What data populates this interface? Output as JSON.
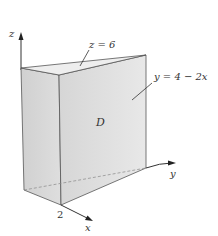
{
  "diagram": {
    "type": "3d-solid-region",
    "labels": {
      "z_axis": "z",
      "y_axis": "y",
      "x_axis": "x",
      "x_tick": "2",
      "top_plane": "z = 6",
      "slant_plane": "y = 4 − 2x",
      "region": "D"
    },
    "colors": {
      "front_face": "#e2e2e2",
      "side_face": "#d4d4d4",
      "top_face": "#eeeeee",
      "edge": "#555555",
      "axis": "#333333"
    }
  }
}
